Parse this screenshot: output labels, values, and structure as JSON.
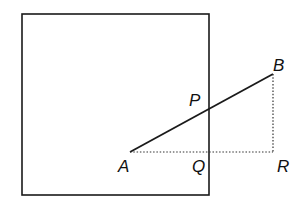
{
  "diagram": {
    "colors": {
      "line": "#1a1a1a",
      "background": "#ffffff"
    },
    "square": {
      "x": 22,
      "y": 14,
      "width": 187,
      "height": 181
    },
    "points": {
      "A": {
        "label": "A",
        "x": 130,
        "y": 152
      },
      "B": {
        "label": "B",
        "x": 273,
        "y": 74
      },
      "P": {
        "label": "P",
        "x": 209,
        "y": 109
      },
      "Q": {
        "label": "Q",
        "x": 209,
        "y": 152
      },
      "R": {
        "label": "R",
        "x": 273,
        "y": 152
      }
    },
    "segments": [
      {
        "from": "A",
        "to": "B",
        "style": "solid"
      },
      {
        "from": "A",
        "to": "R",
        "style": "dotted"
      },
      {
        "from": "B",
        "to": "R",
        "style": "dotted"
      }
    ],
    "labels": {
      "A": "A",
      "B": "B",
      "P": "P",
      "Q": "Q",
      "R": "R"
    }
  }
}
